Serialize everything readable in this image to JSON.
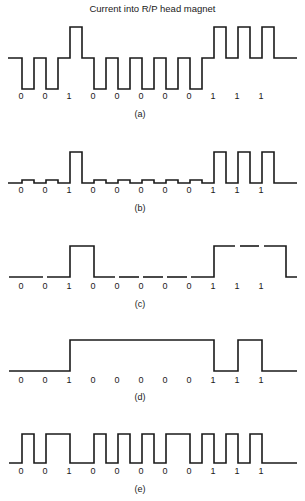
{
  "figure": {
    "title": "Current into R/P head magnet",
    "bits": [
      "0",
      "0",
      "1",
      "0",
      "0",
      "0",
      "0",
      "0",
      "1",
      "1",
      "1"
    ],
    "panels": [
      {
        "id": "a",
        "caption": "(a)",
        "description": "Return-to-bias: positive pulse for 1, negative pulse for 0"
      },
      {
        "id": "b",
        "caption": "(b)",
        "description": "Pulse for 1, small bump for 0"
      },
      {
        "id": "c",
        "caption": "(c)",
        "description": "Non-return-to-zero level, segmented per bit"
      },
      {
        "id": "d",
        "caption": "(d)",
        "description": "NRZI: transition on each 1"
      },
      {
        "id": "e",
        "caption": "(e)",
        "description": "Phase/frequency encoding with clock transitions"
      }
    ]
  }
}
